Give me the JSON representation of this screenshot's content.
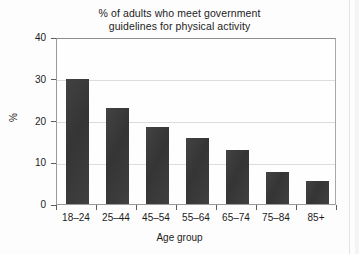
{
  "chart_data": {
    "type": "bar",
    "title": "% of adults who meet government guidelines for physical activity",
    "title_lines": [
      "% of adults who meet government",
      "guidelines for physical activity"
    ],
    "categories": [
      "18–24",
      "25–44",
      "45–54",
      "55–64",
      "65–74",
      "75–84",
      "85+"
    ],
    "values": [
      30,
      23,
      18.5,
      15.7,
      13,
      7.7,
      5.5
    ],
    "xlabel": "Age group",
    "ylabel": "%",
    "ylim": [
      0,
      40
    ],
    "ytick_labels": [
      "0",
      "10",
      "20",
      "30",
      "40"
    ],
    "ytick_values": [
      0,
      10,
      20,
      30,
      40
    ],
    "grid": "horizontal gridlines at 10, 20, 30",
    "legend": "none",
    "bar_color": "#383838",
    "axis_color": "#9a9a9a",
    "grid_color": "#dcdcdc",
    "background_color": "#fdfdfd"
  }
}
